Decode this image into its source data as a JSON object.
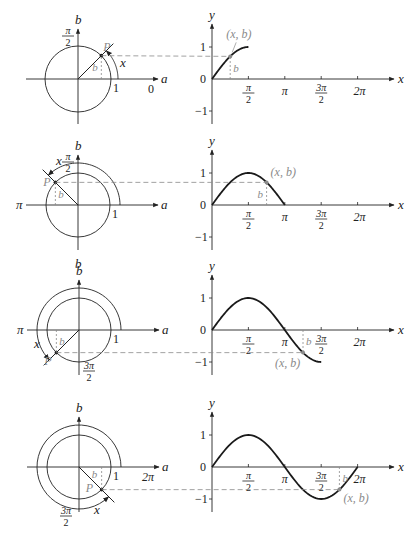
{
  "colors": {
    "ink": "#222222",
    "gray": "#8a8a8a",
    "curve": "#1a1a1a",
    "background": "#ffffff"
  },
  "labels": {
    "circle_h_axis": "a",
    "circle_v_axis": "b",
    "graph_h_axis": "x",
    "graph_v_axis": "y",
    "point": "P",
    "angle": "x",
    "height": "b",
    "one": "1",
    "pi": "π",
    "pi_over_2_num": "π",
    "pi_over_2_den": "2",
    "three_pi_over_2_num": "3π",
    "three_pi_over_2_den": "2",
    "two_pi": "2π",
    "zero": "0",
    "y_one": "1",
    "y_zero": "0",
    "y_neg_one": "−1",
    "point_coords": "(x, b)"
  },
  "panels": [
    {
      "id": "panel-1",
      "angle_deg": 45,
      "circle_center": [
        78,
        79
      ],
      "circle_radius": 33,
      "arc_radius": 40,
      "circle_axis_end_label": "0",
      "circle_top_label": "π/2",
      "graph_origin": [
        212,
        79
      ],
      "curve_end_x_rad": 1.5708,
      "point_x_rad": 0.7854,
      "point_y": 0.707
    },
    {
      "id": "panel-2",
      "angle_deg": 135,
      "circle_center": [
        78,
        205
      ],
      "circle_radius": 32,
      "arc_radius": 42,
      "circle_left_label": "π",
      "circle_top_label": "π/2",
      "circle_bottom_label": "b",
      "graph_origin": [
        212,
        205
      ],
      "curve_end_x_rad": 3.1416,
      "point_x_rad": 2.3562,
      "point_y": 0.707
    },
    {
      "id": "panel-3",
      "angle_deg": 225,
      "circle_center": [
        79,
        330
      ],
      "circle_radius": 32,
      "arc_radius": 42,
      "circle_left_label": "π",
      "circle_bottom_label": "3π/2",
      "graph_origin": [
        212,
        330
      ],
      "curve_end_x_rad": 4.7124,
      "point_x_rad": 3.927,
      "point_y": -0.707
    },
    {
      "id": "panel-4",
      "angle_deg": 315,
      "circle_center": [
        79,
        467
      ],
      "circle_radius": 32,
      "arc_radius": 42,
      "circle_axis_end_label": "2π",
      "circle_bottom_label": "3π/2",
      "graph_origin": [
        212,
        467
      ],
      "curve_end_x_rad": 6.2832,
      "point_x_rad": 5.4978,
      "point_y": -0.707
    }
  ],
  "chart_data": [
    {
      "type": "line",
      "title": "y = sin x traced for 0 ≤ x ≤ π/2",
      "xlabel": "x",
      "ylabel": "y",
      "x_ticks": [
        "π/2",
        "π",
        "3π/2",
        "2π"
      ],
      "y_ticks": [
        "1",
        "0",
        "−1"
      ],
      "x": [
        0,
        0.3927,
        0.7854,
        1.1781,
        1.5708
      ],
      "values": [
        0,
        0.383,
        0.707,
        0.924,
        1
      ],
      "highlight_point": {
        "label": "(x, b)",
        "x": 0.7854,
        "y": 0.707
      },
      "xlim": [
        0,
        6.2832
      ],
      "ylim": [
        -1,
        1
      ],
      "grid": false
    },
    {
      "type": "line",
      "title": "y = sin x traced for 0 ≤ x ≤ π",
      "xlabel": "x",
      "ylabel": "y",
      "x_ticks": [
        "π/2",
        "π",
        "3π/2",
        "2π"
      ],
      "y_ticks": [
        "1",
        "0",
        "−1"
      ],
      "x": [
        0,
        0.7854,
        1.5708,
        2.3562,
        3.1416
      ],
      "values": [
        0,
        0.707,
        1,
        0.707,
        0
      ],
      "highlight_point": {
        "label": "(x, b)",
        "x": 2.3562,
        "y": 0.707
      },
      "xlim": [
        0,
        6.2832
      ],
      "ylim": [
        -1,
        1
      ],
      "grid": false
    },
    {
      "type": "line",
      "title": "y = sin x traced for 0 ≤ x ≤ 3π/2",
      "xlabel": "x",
      "ylabel": "y",
      "x_ticks": [
        "π/2",
        "π",
        "3π/2",
        "2π"
      ],
      "y_ticks": [
        "1",
        "0",
        "−1"
      ],
      "x": [
        0,
        0.7854,
        1.5708,
        2.3562,
        3.1416,
        3.927,
        4.7124
      ],
      "values": [
        0,
        0.707,
        1,
        0.707,
        0,
        -0.707,
        -1
      ],
      "highlight_point": {
        "label": "(x, b)",
        "x": 3.927,
        "y": -0.707
      },
      "xlim": [
        0,
        6.2832
      ],
      "ylim": [
        -1,
        1
      ],
      "grid": false
    },
    {
      "type": "line",
      "title": "y = sin x traced for 0 ≤ x ≤ 2π",
      "xlabel": "x",
      "ylabel": "y",
      "x_ticks": [
        "π/2",
        "π",
        "3π/2",
        "2π"
      ],
      "y_ticks": [
        "1",
        "0",
        "−1"
      ],
      "x": [
        0,
        0.7854,
        1.5708,
        2.3562,
        3.1416,
        3.927,
        4.7124,
        5.4978,
        6.2832
      ],
      "values": [
        0,
        0.707,
        1,
        0.707,
        0,
        -0.707,
        -1,
        -0.707,
        0
      ],
      "highlight_point": {
        "label": "(x, b)",
        "x": 5.4978,
        "y": -0.707
      },
      "xlim": [
        0,
        6.2832
      ],
      "ylim": [
        -1,
        1
      ],
      "grid": false
    }
  ]
}
